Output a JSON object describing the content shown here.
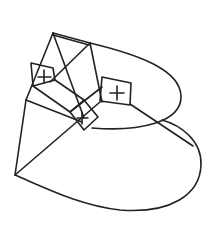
{
  "diagram": {
    "type": "wireframe-line-drawing",
    "colors": {
      "background": "#ffffff",
      "stroke": "#222222"
    },
    "markers": [
      {
        "name": "upper-left-square-plus",
        "symbol": "+"
      },
      {
        "name": "right-square-plus",
        "symbol": "+"
      },
      {
        "name": "center-square-mark",
        "symbol": "+"
      }
    ]
  }
}
